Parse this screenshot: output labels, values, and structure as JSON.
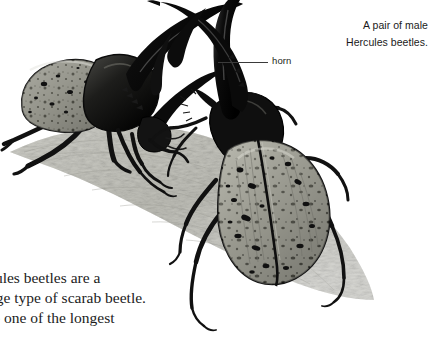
{
  "page": {
    "background_color": "#ffffff",
    "width": 430,
    "height": 337
  },
  "illustration": {
    "name": "hercules-beetles-illustration",
    "subject": "Two male Hercules beetles facing each other on a log",
    "style": "black and white stipple / scratchboard drawing",
    "colors": {
      "horn_black": "#0d0d0d",
      "elytra_gray": "#8d8d85",
      "elytra_highlight": "#c9c9c0",
      "elytra_shadow": "#4a4a46",
      "ground_gray": "#cfcfc9",
      "ground_shadow": "#a9a9a2",
      "outline": "#141414"
    },
    "elements": [
      "left-beetle-side-view",
      "right-beetle-top-view",
      "crossed-horns",
      "log-ground-surface"
    ]
  },
  "callouts": [
    {
      "label": "horn",
      "leader_line": true
    }
  ],
  "caption": {
    "lines": [
      "A pair of male",
      "Hercules beetles."
    ],
    "align": "right",
    "color": "#1a1a1a"
  },
  "body_text": {
    "clipped_left": true,
    "lines": [
      "cules beetles are a",
      "uge type of scarab beetle.",
      "re one of the longest"
    ],
    "color": "#1c1c1c"
  }
}
